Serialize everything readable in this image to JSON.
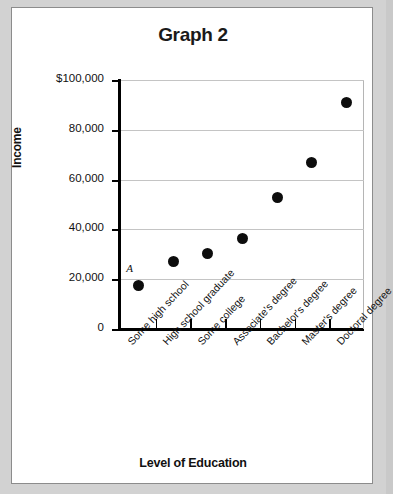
{
  "chart_data": {
    "type": "scatter",
    "title": "Graph 2",
    "xlabel": "Level of Education",
    "ylabel": "Income",
    "categories": [
      "Some high school",
      "High school graduate",
      "Some college",
      "Associate's degree",
      "Bachelor's degree",
      "Master's degree",
      "Doctoral degree"
    ],
    "values": [
      17500,
      27000,
      30500,
      36500,
      53000,
      67000,
      91000
    ],
    "ylim": [
      0,
      100000
    ],
    "ytick_labels": [
      "$100,000",
      "80,000",
      "60,000",
      "40,000",
      "20,000",
      "0"
    ],
    "ytick_values": [
      100000,
      80000,
      60000,
      40000,
      20000,
      0
    ],
    "grid": true,
    "legend": "none",
    "annotations": [
      {
        "label": "A",
        "category": "Some high school",
        "value": 17500
      }
    ]
  },
  "colors": {
    "point": "#0d0d0d",
    "grid": "#c4c4c4",
    "axis": "#000000",
    "panel": "#ffffff",
    "page": "#d2d2d2"
  }
}
